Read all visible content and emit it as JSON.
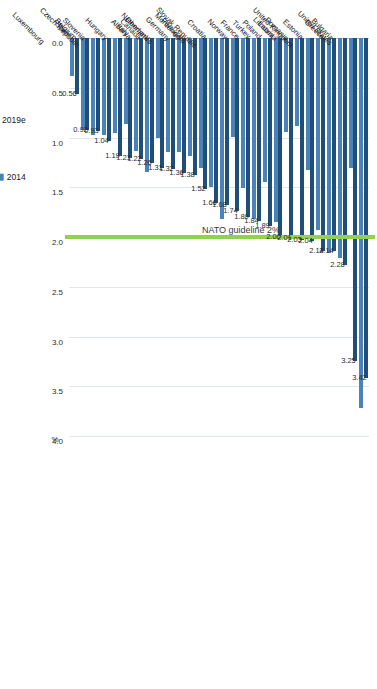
{
  "chart_data": {
    "type": "bar",
    "orientation": "horizontal",
    "title": "",
    "xlabel": "",
    "ylabel": "",
    "unit_label": "%",
    "xlim": [
      0.0,
      4.0
    ],
    "ticks": [
      "0.0",
      "0.5",
      "1.0",
      "1.5",
      "2.0",
      "2.5",
      "3.0",
      "3.5",
      "4.0"
    ],
    "tick_values": [
      0.0,
      0.5,
      1.0,
      1.5,
      2.0,
      2.5,
      3.0,
      3.5,
      4.0
    ],
    "grid": true,
    "legend_position": "right",
    "reference_line": {
      "label": "NATO guideline 2%",
      "value": 2.0,
      "color": "#92d050"
    },
    "series": [
      {
        "name": "2019e",
        "color": "#1f4e79"
      },
      {
        "name": "2014",
        "color": "#4a82bc"
      }
    ],
    "categories": [
      "United States",
      "Bulgaria",
      "Greece",
      "United Kingdom",
      "Estonia",
      "Romania",
      "Lithuania",
      "Latvia",
      "Poland",
      "Turkey",
      "France",
      "Norway",
      "Slovak Republic",
      "Croatia",
      "Montenegro",
      "Portugal",
      "Germany",
      "Netherlands",
      "Denmark",
      "Canada",
      "Albania",
      "Italy",
      "Hungary",
      "Czech Republic",
      "Slovenia",
      "Belgium",
      "Spain",
      "Luxembourg"
    ],
    "values_2019e": [
      3.42,
      3.25,
      2.28,
      2.14,
      2.14,
      2.04,
      2.03,
      2.01,
      2.0,
      1.89,
      1.84,
      1.8,
      1.74,
      1.68,
      1.66,
      1.52,
      1.38,
      1.36,
      1.32,
      1.31,
      1.26,
      1.22,
      1.21,
      1.19,
      1.04,
      0.93,
      0.92,
      0.56
    ],
    "values_2014": [
      3.72,
      1.31,
      2.21,
      2.16,
      1.93,
      1.33,
      0.88,
      0.94,
      1.85,
      1.45,
      1.82,
      1.51,
      0.99,
      1.82,
      1.5,
      1.31,
      1.19,
      1.15,
      1.15,
      1.01,
      1.35,
      1.14,
      0.86,
      0.95,
      0.97,
      0.97,
      0.92,
      0.38
    ],
    "value_labels": [
      "3.42",
      "3.25",
      "2.28",
      "2.14",
      "2.14",
      "2.04",
      "2.03",
      "2.01",
      "2.00",
      "1.89",
      "1.84",
      "1.80",
      "1.74",
      "1.68",
      "1.66",
      "1.52",
      "1.38",
      "1.36",
      "1.32",
      "1.31",
      "1.26",
      "1.22",
      "1.21",
      "1.19",
      "1.04",
      "0.93",
      "0.92",
      "0.56"
    ]
  }
}
